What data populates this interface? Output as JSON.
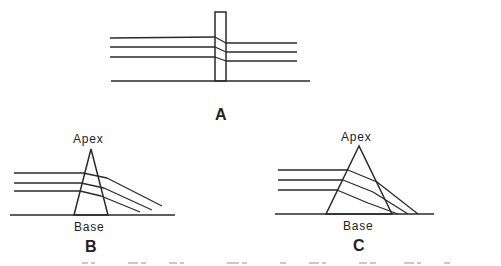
{
  "diagram": {
    "stroke_color": "#2a2a2a",
    "panels": [
      {
        "id": "A",
        "label": "A",
        "shape": "narrow vertical rectangle",
        "rect": {
          "x": 215,
          "y": 12,
          "w": 11,
          "h": 69
        },
        "baseline": [
          [
            111,
            81
          ],
          [
            310,
            81
          ]
        ],
        "layers": [
          [
            [
              110,
              38
            ],
            [
              215,
              37
            ],
            [
              226,
              43
            ],
            [
              297,
              43
            ]
          ],
          [
            [
              110,
              47
            ],
            [
              215,
              47
            ],
            [
              226,
              52
            ],
            [
              297,
              52
            ]
          ],
          [
            [
              110,
              57
            ],
            [
              215,
              57
            ],
            [
              226,
              61
            ],
            [
              297,
              61
            ]
          ]
        ]
      },
      {
        "id": "B",
        "label": "B",
        "apex_label": "Apex",
        "base_label": "Base",
        "shape": "narrow triangle",
        "triangle": [
          [
            91,
            149
          ],
          [
            74,
            215
          ],
          [
            108,
            215
          ]
        ],
        "baseline": [
          [
            10,
            215
          ],
          [
            175,
            215
          ]
        ],
        "layers": [
          [
            [
              14,
              173
            ],
            [
              83,
              173
            ],
            [
              107,
              178
            ],
            [
              162,
              206
            ]
          ],
          [
            [
              14,
              183
            ],
            [
              81,
              183
            ],
            [
              104,
              188
            ],
            [
              152,
              210
            ]
          ],
          [
            [
              14,
              191
            ],
            [
              80,
              191
            ],
            [
              101,
              196
            ],
            [
              140,
              212
            ]
          ]
        ]
      },
      {
        "id": "C",
        "label": "C",
        "apex_label": "Apex",
        "base_label": "Base",
        "shape": "wide triangle",
        "triangle": [
          [
            359,
            146
          ],
          [
            326,
            214
          ],
          [
            392,
            214
          ]
        ],
        "baseline": [
          [
            275,
            214
          ],
          [
            434,
            214
          ]
        ],
        "layers": [
          [
            [
              278,
              170
            ],
            [
              348,
              170
            ],
            [
              377,
              182
            ],
            [
              418,
              214
            ]
          ],
          [
            [
              278,
              180
            ],
            [
              343,
              180
            ],
            [
              373,
              192
            ],
            [
              408,
              214
            ]
          ],
          [
            [
              278,
              190
            ],
            [
              337,
              190
            ],
            [
              368,
              203
            ],
            [
              398,
              214
            ]
          ]
        ]
      }
    ]
  },
  "labels": {
    "a": "A",
    "b_apex": "Apex",
    "b_base": "Base",
    "b": "B",
    "c_apex": "Apex",
    "c_base": "Base",
    "c": "C"
  }
}
